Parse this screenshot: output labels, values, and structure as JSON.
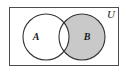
{
  "figure": {
    "type": "venn-diagram",
    "shaded_region_description": "B minus A (elements in B but not in A)",
    "background_color": "#ffffff"
  },
  "universe": {
    "label": "U",
    "border_color": "#4d4d4d",
    "fill_color": "#ffffff",
    "rect": {
      "x": 9,
      "y": 7,
      "width": 110,
      "height": 59
    },
    "label_position": {
      "x": 111,
      "y": 18
    },
    "label_font_size": 11
  },
  "sets": [
    {
      "id": "set-a",
      "label": "A",
      "fill_color": "#ffffff",
      "shaded": false,
      "stroke_color": "#333333",
      "center": {
        "x": 46,
        "y": 37
      },
      "radius": 23,
      "label_position": {
        "x": 36,
        "y": 40
      },
      "label_font_size": 10
    },
    {
      "id": "set-b",
      "label": "B",
      "fill_color": "#c9c9c9",
      "shaded": true,
      "stroke_color": "#333333",
      "center": {
        "x": 82,
        "y": 37
      },
      "radius": 23,
      "label_position": {
        "x": 87,
        "y": 40
      },
      "label_font_size": 10
    }
  ],
  "regions": {
    "a_only": {
      "name": "A only",
      "fill_color": "#ffffff",
      "shaded": false
    },
    "intersection": {
      "name": "A intersect B",
      "fill_color": "#ffffff",
      "shaded": false
    },
    "b_only": {
      "name": "B only",
      "fill_color": "#c9c9c9",
      "shaded": true
    },
    "outside": {
      "name": "Outside both sets",
      "fill_color": "#ffffff",
      "shaded": false
    }
  }
}
